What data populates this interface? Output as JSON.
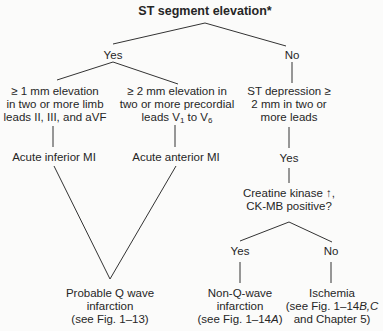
{
  "diagram": {
    "title": "ST segment elevation*",
    "branch_yes": "Yes",
    "branch_no": "No",
    "inferior_criteria": [
      "≥ 1 mm elevation",
      "in two or more limb",
      "leads II, III, and aVF"
    ],
    "anterior_criteria": {
      "line1": "≥ 2 mm elevation in",
      "line2": "two or more precordial",
      "line3_prefix": "leads V",
      "line3_sub1": "1",
      "line3_mid": " to V",
      "line3_sub2": "6"
    },
    "st_depression": [
      "ST depression ≥",
      "2 mm in two or",
      "more leads"
    ],
    "acute_inferior": "Acute inferior MI",
    "acute_anterior": "Acute anterior MI",
    "depression_yes": "Yes",
    "ck_question": [
      "Creatine kinase ↑,",
      "CK-MB positive?"
    ],
    "ck_yes": "Yes",
    "ck_no": "No",
    "q_wave": [
      "Probable Q wave",
      "infarction",
      "(see Fig. 1–13)"
    ],
    "non_q_wave": {
      "line1": "Non-Q-wave",
      "line2": "infarction",
      "line3_prefix": "(see Fig. 1–14",
      "line3_italic": "A",
      "line3_suffix": ")"
    },
    "ischemia": {
      "line1": "Ischemia",
      "line2_prefix": "(see Fig. 1–14",
      "line2_italic": "B,C",
      "line3": "and Chapter 5)"
    }
  }
}
